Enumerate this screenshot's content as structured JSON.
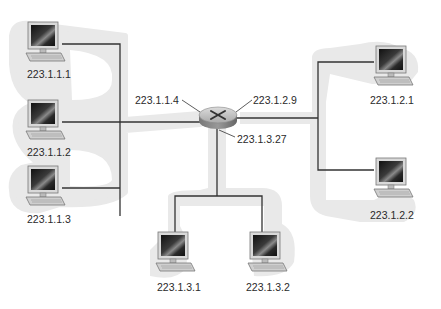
{
  "diagram": {
    "type": "network-topology",
    "router": {
      "name": "router",
      "interfaces": [
        {
          "label": "223.1.1.4",
          "subnet": "223.1.1"
        },
        {
          "label": "223.1.2.9",
          "subnet": "223.1.2"
        },
        {
          "label": "223.1.3.27",
          "subnet": "223.1.3"
        }
      ]
    },
    "subnets": [
      {
        "id": "223.1.1",
        "hosts": [
          {
            "label": "223.1.1.1"
          },
          {
            "label": "223.1.1.2"
          },
          {
            "label": "223.1.1.3"
          }
        ]
      },
      {
        "id": "223.1.2",
        "hosts": [
          {
            "label": "223.1.2.1"
          },
          {
            "label": "223.1.2.2"
          }
        ]
      },
      {
        "id": "223.1.3",
        "hosts": [
          {
            "label": "223.1.3.1"
          },
          {
            "label": "223.1.3.2"
          }
        ]
      }
    ],
    "colors": {
      "line": "#333333",
      "subnet_shade": "#e8e8e8",
      "router_body": "#b8b8b8",
      "monitor_screen": "#1c1c1c",
      "text": "#2a2a2a"
    }
  }
}
